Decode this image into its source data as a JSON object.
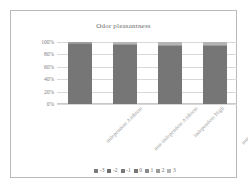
{
  "chart_data": {
    "type": "bar",
    "title": "Odor pleasantness",
    "subtitle": "",
    "xlabel": "",
    "ylabel": "",
    "categories": [
      "independent Ambient",
      "non-independent Ambient",
      "independent High",
      "non-independent High"
    ],
    "series": [
      {
        "name": "-3",
        "color": "#7b7b7b",
        "values": [
          0,
          0,
          0,
          0
        ]
      },
      {
        "name": "-2",
        "color": "#6e6e6e",
        "values": [
          0,
          0,
          0,
          0
        ]
      },
      {
        "name": "-1",
        "color": "#7a7a7a",
        "values": [
          0,
          0,
          0,
          0
        ]
      },
      {
        "name": "0",
        "color": "#767676",
        "values": [
          97,
          95,
          94,
          93
        ]
      },
      {
        "name": "1",
        "color": "#8a8a8a",
        "values": [
          0,
          0,
          0,
          0
        ]
      },
      {
        "name": "2",
        "color": "#9b9b9b",
        "values": [
          3,
          2,
          2,
          2
        ]
      },
      {
        "name": "3",
        "color": "#b5b5b5",
        "values": [
          0,
          3,
          4,
          5
        ]
      }
    ],
    "stacked": true,
    "ylim": [
      0,
      100
    ],
    "yticks": [
      "0%",
      "20%",
      "40%",
      "60%",
      "80%",
      "100%"
    ],
    "ytick_values": [
      0,
      20,
      40,
      60,
      80,
      100
    ],
    "grid": true,
    "legend_position": "bottom",
    "legend_entries": [
      "-3",
      "-2",
      "-1",
      "0",
      "1",
      "2",
      "3"
    ],
    "bar_totals": [
      100,
      100,
      100,
      100
    ],
    "value_unit": "percent"
  },
  "style": {
    "bar_color": "#767676",
    "cap_color": "#a0a0a0",
    "grid_color": "#d8d8d8",
    "frame_color": "#b9b9b9",
    "text_color": "#7c7c7c",
    "background": "#ffffff"
  }
}
